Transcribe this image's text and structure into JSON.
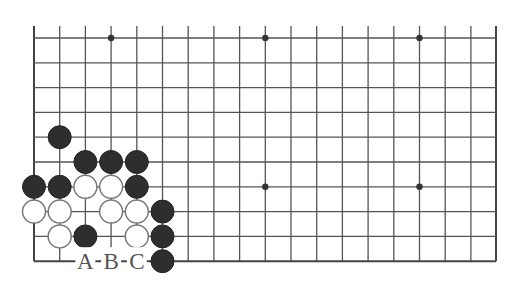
{
  "diagram": {
    "type": "go-board-corner",
    "grid": {
      "columns": 19,
      "rows": 10,
      "origin_x": 34,
      "origin_y": 38,
      "col_spacing": 25.7,
      "row_spacing": 24.8,
      "open_top": true,
      "open_left": false,
      "edge_bottom": true,
      "edge_right": true
    },
    "star_points": [
      {
        "col": 3,
        "row": 0
      },
      {
        "col": 9,
        "row": 0
      },
      {
        "col": 15,
        "row": 0
      },
      {
        "col": 9,
        "row": 6
      },
      {
        "col": 15,
        "row": 6
      }
    ],
    "stones": [
      {
        "color": "black",
        "col": 1,
        "row": 4
      },
      {
        "color": "black",
        "col": 2,
        "row": 5
      },
      {
        "color": "black",
        "col": 3,
        "row": 5
      },
      {
        "color": "black",
        "col": 4,
        "row": 5
      },
      {
        "color": "black",
        "col": 0,
        "row": 6
      },
      {
        "color": "black",
        "col": 1,
        "row": 6
      },
      {
        "color": "white",
        "col": 2,
        "row": 6
      },
      {
        "color": "white",
        "col": 3,
        "row": 6
      },
      {
        "color": "black",
        "col": 4,
        "row": 6
      },
      {
        "color": "white",
        "col": 0,
        "row": 7
      },
      {
        "color": "white",
        "col": 1,
        "row": 7
      },
      {
        "color": "white",
        "col": 3,
        "row": 7
      },
      {
        "color": "white",
        "col": 4,
        "row": 7
      },
      {
        "color": "black",
        "col": 5,
        "row": 7
      },
      {
        "color": "white",
        "col": 1,
        "row": 8
      },
      {
        "color": "black",
        "col": 2,
        "row": 8
      },
      {
        "color": "white",
        "col": 4,
        "row": 8
      },
      {
        "color": "black",
        "col": 5,
        "row": 8
      },
      {
        "color": "black",
        "col": 5,
        "row": 9
      }
    ],
    "labels": [
      {
        "text": "A",
        "col": 2,
        "row": 9
      },
      {
        "text": "B",
        "col": 3,
        "row": 9
      },
      {
        "text": "C",
        "col": 4,
        "row": 9
      }
    ],
    "colors": {
      "line": "#555555",
      "black_stone": "#2e2e2e",
      "white_stone_border": "#777777",
      "label": "#555555"
    }
  }
}
